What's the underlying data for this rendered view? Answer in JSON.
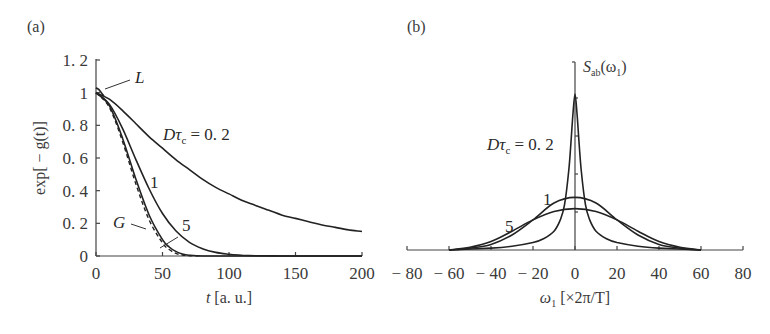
{
  "chart_data": [
    {
      "panel": "(a)",
      "type": "line",
      "title": "",
      "xlabel": "t [a. u.]",
      "ylabel": "exp[ − g(t)]",
      "xlim": [
        0,
        200
      ],
      "ylim": [
        0,
        1.2
      ],
      "xticks": [
        "0",
        "50",
        "100",
        "150",
        "200"
      ],
      "yticks": [
        "0",
        "0.2",
        "0.4",
        "0.6",
        "0.8",
        "1",
        "1.2"
      ],
      "grid": false,
      "series": [
        {
          "name": "Dτc = 0.2",
          "style": "solid",
          "x": [
            0,
            10,
            20,
            30,
            40,
            50,
            60,
            70,
            80,
            90,
            100,
            110,
            120,
            130,
            140,
            150,
            160,
            170,
            180,
            190,
            200
          ],
          "y": [
            1.0,
            0.96,
            0.89,
            0.81,
            0.73,
            0.66,
            0.59,
            0.53,
            0.47,
            0.42,
            0.38,
            0.34,
            0.31,
            0.28,
            0.25,
            0.23,
            0.21,
            0.19,
            0.175,
            0.16,
            0.15
          ]
        },
        {
          "name": "1",
          "style": "solid",
          "x": [
            0,
            10,
            20,
            30,
            40,
            50,
            60,
            70,
            80,
            90,
            100,
            110,
            120,
            140,
            160,
            200
          ],
          "y": [
            1.0,
            0.93,
            0.78,
            0.59,
            0.41,
            0.26,
            0.155,
            0.085,
            0.045,
            0.022,
            0.011,
            0.005,
            0.002,
            0.0,
            0.0,
            0.0
          ]
        },
        {
          "name": "5",
          "style": "solid",
          "x": [
            0,
            10,
            20,
            30,
            40,
            50,
            55,
            60,
            65,
            70,
            80,
            100,
            200
          ],
          "y": [
            1.0,
            0.92,
            0.72,
            0.47,
            0.25,
            0.1,
            0.055,
            0.028,
            0.012,
            0.005,
            0.0,
            0.0,
            0.0
          ]
        },
        {
          "name": "G",
          "style": "dashed",
          "x": [
            0,
            10,
            20,
            30,
            40,
            50,
            55,
            60,
            65,
            70,
            80
          ],
          "y": [
            1.0,
            0.91,
            0.7,
            0.44,
            0.22,
            0.08,
            0.04,
            0.016,
            0.006,
            0.002,
            0.0
          ]
        },
        {
          "name": "L",
          "style": "solid",
          "x": [
            0,
            2,
            4,
            6
          ],
          "y": [
            1.03,
            1.02,
            1.0,
            0.98
          ]
        }
      ],
      "annotations": [
        {
          "text": "L",
          "points_to": [
            1,
            1.02
          ]
        },
        {
          "text": "Dτc = 0.2",
          "at": [
            70,
            0.75
          ]
        },
        {
          "text": "1",
          "at": [
            52,
            0.5
          ]
        },
        {
          "text": "5",
          "at": [
            73,
            0.24
          ]
        },
        {
          "text": "G",
          "at": [
            18,
            0.2
          ],
          "points_to": [
            38,
            0.16
          ]
        }
      ]
    },
    {
      "panel": "(b)",
      "type": "line",
      "title": "",
      "xlabel": "ω1 [×2π/T]",
      "ylabel": "Sab(ω1)",
      "xlim": [
        -80,
        80
      ],
      "ylim": [
        0,
        1
      ],
      "xticks": [
        "−80",
        "−60",
        "−40",
        "−20",
        "0",
        "20",
        "40",
        "60",
        "80"
      ],
      "yticks": [],
      "grid": false,
      "series": [
        {
          "name": "Dτc = 0.2",
          "style": "solid",
          "shape": "lorentzian-like",
          "peak": 0.83,
          "hwhm": 3.0,
          "x": [
            -60,
            -40,
            -30,
            -20,
            -15,
            -10,
            -7,
            -5,
            -3,
            -2,
            -1,
            0,
            1,
            2,
            3,
            5,
            7,
            10,
            15,
            20,
            30,
            40,
            60
          ],
          "y": [
            0.0,
            0.01,
            0.02,
            0.04,
            0.06,
            0.1,
            0.16,
            0.24,
            0.42,
            0.56,
            0.72,
            0.83,
            0.72,
            0.56,
            0.42,
            0.24,
            0.16,
            0.1,
            0.06,
            0.04,
            0.02,
            0.01,
            0.0
          ]
        },
        {
          "name": "1",
          "style": "solid",
          "peak": 0.28,
          "hwhm": 14,
          "x": [
            -60,
            -50,
            -40,
            -30,
            -20,
            -10,
            0,
            10,
            20,
            30,
            40,
            50,
            60
          ],
          "y": [
            0.0,
            0.01,
            0.03,
            0.08,
            0.16,
            0.25,
            0.28,
            0.25,
            0.16,
            0.08,
            0.03,
            0.01,
            0.0
          ]
        },
        {
          "name": "5",
          "style": "solid",
          "peak": 0.22,
          "hwhm": 19,
          "x": [
            -60,
            -50,
            -40,
            -30,
            -20,
            -10,
            0,
            10,
            20,
            30,
            40,
            50,
            60
          ],
          "y": [
            0.0,
            0.015,
            0.045,
            0.1,
            0.16,
            0.205,
            0.22,
            0.205,
            0.16,
            0.1,
            0.045,
            0.015,
            0.0
          ]
        }
      ],
      "annotations": [
        {
          "text": "Dτc = 0.2",
          "at": [
            -28,
            0.6
          ]
        },
        {
          "text": "1",
          "at": [
            -8,
            0.3
          ]
        },
        {
          "text": "5",
          "at": [
            -34,
            0.2
          ]
        },
        {
          "text": "Sab(ω1)",
          "at": [
            2,
            1.0
          ]
        }
      ]
    }
  ],
  "labels": {
    "panel_a": "(a)",
    "panel_b": "(b)",
    "a_xlabel_var": "t",
    "a_xlabel_unit": " [a. u.]",
    "a_ylabel": "exp[ − g(t)]",
    "a_dtau": "Dτ",
    "a_dtau_sub": "c",
    "a_dtau_val": " = 0. 2",
    "a_one": "1",
    "a_five": "5",
    "a_G": "G",
    "a_L": "L",
    "a_xticks": [
      "0",
      "50",
      "100",
      "150",
      "200"
    ],
    "a_yticks": [
      "0",
      "0. 2",
      "0. 4",
      "0. 6",
      "0. 8",
      "1",
      "1. 2"
    ],
    "b_xlabel_var": "ω",
    "b_xlabel_sub": "1",
    "b_xlabel_unit": " [×2π/T]",
    "b_ylabel_S": "S",
    "b_ylabel_sub": "ab",
    "b_ylabel_arg": "(ω",
    "b_ylabel_arg_sub": "1",
    "b_ylabel_close": ")",
    "b_dtau": "Dτ",
    "b_dtau_sub": "c",
    "b_dtau_val": " = 0. 2",
    "b_one": "1",
    "b_five": "5",
    "b_xticks": [
      "− 80",
      "− 60",
      "− 40",
      "− 20",
      "0",
      "20",
      "40",
      "60",
      "80"
    ]
  }
}
